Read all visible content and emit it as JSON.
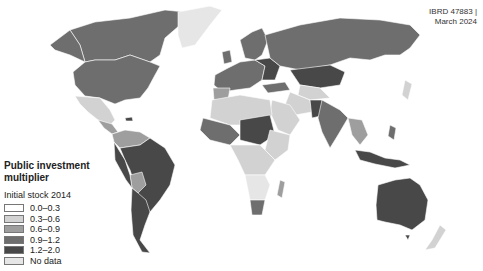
{
  "map": {
    "id_label": "IBRD 47883 |",
    "date_label": "March 2024",
    "legend": {
      "title_line1": "Public investment",
      "title_line2": "multiplier",
      "subtitle": "Initial stock 2014",
      "items": [
        {
          "label": "0.0–0.3",
          "color": "#ffffff"
        },
        {
          "label": "0.3–0.6",
          "color": "#d2d2d2"
        },
        {
          "label": "0.6–0.9",
          "color": "#9e9e9e"
        },
        {
          "label": "0.9–1.2",
          "color": "#6e6e6e"
        },
        {
          "label": "1.2–2.0",
          "color": "#484848"
        },
        {
          "label": "No data",
          "color": "#e6e6e6"
        }
      ]
    }
  }
}
